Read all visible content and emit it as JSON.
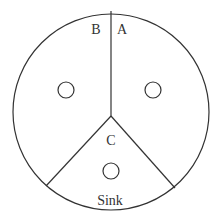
{
  "diagram": {
    "type": "sectored-circle",
    "stroke_color": "#333333",
    "outer_circle": {
      "cx": 111,
      "cy": 112,
      "r": 98
    },
    "center": {
      "x": 111,
      "y": 116
    },
    "spokes": [
      {
        "name": "top",
        "x2": 111,
        "y2": 11
      },
      {
        "name": "left",
        "x2": 46,
        "y2": 186
      },
      {
        "name": "right",
        "x2": 175,
        "y2": 188
      }
    ],
    "sectors": [
      {
        "id": "A",
        "label": "A",
        "label_pos": {
          "x": 122,
          "y": 34
        },
        "marker": {
          "cx": 153,
          "cy": 90,
          "r": 8
        }
      },
      {
        "id": "B",
        "label": "B",
        "label_pos": {
          "x": 96,
          "y": 34
        },
        "marker": {
          "cx": 66,
          "cy": 90,
          "r": 8
        }
      },
      {
        "id": "C",
        "label": "C",
        "label_pos": {
          "x": 111,
          "y": 145
        },
        "marker": {
          "cx": 111,
          "cy": 171,
          "r": 8
        },
        "sublabel": "Sink",
        "sublabel_pos": {
          "x": 110,
          "y": 205
        }
      }
    ]
  }
}
